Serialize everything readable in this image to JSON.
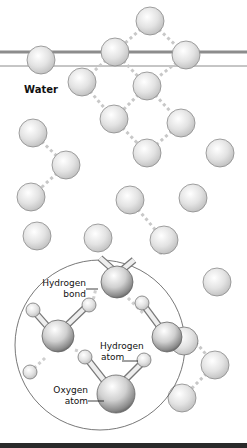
{
  "diagram": {
    "title": "Water",
    "labels": {
      "hydrogen_bond": [
        "Hydrogen",
        "bond"
      ],
      "hydrogen_atom": [
        "Hydrogen",
        "atom"
      ],
      "oxygen_atom": [
        "Oxygen",
        "atom"
      ]
    },
    "colors": {
      "sphere_fill": "#d9d9d9",
      "sphere_stroke": "#8a8a8a",
      "bond_dash": "#c8c8c8",
      "surface_line": "#8c8c8c",
      "bottom_bar": "#2a2a2a"
    },
    "surface_lines_y": [
      52,
      66
    ],
    "molecules": [
      {
        "x": 150,
        "y": 21
      },
      {
        "x": 115,
        "y": 52
      },
      {
        "x": 186,
        "y": 55
      },
      {
        "x": 41,
        "y": 60
      },
      {
        "x": 82,
        "y": 82
      },
      {
        "x": 147,
        "y": 86
      },
      {
        "x": 33,
        "y": 133
      },
      {
        "x": 114,
        "y": 119
      },
      {
        "x": 181,
        "y": 123
      },
      {
        "x": 147,
        "y": 153
      },
      {
        "x": 220,
        "y": 153
      },
      {
        "x": 66,
        "y": 165
      },
      {
        "x": 31,
        "y": 197
      },
      {
        "x": 130,
        "y": 200
      },
      {
        "x": 193,
        "y": 198
      },
      {
        "x": 37,
        "y": 236
      },
      {
        "x": 98,
        "y": 238
      },
      {
        "x": 164,
        "y": 240
      },
      {
        "x": 217,
        "y": 282
      },
      {
        "x": 215,
        "y": 365
      },
      {
        "x": 182,
        "y": 398
      }
    ],
    "hbonds": [
      [
        150,
        21,
        115,
        52
      ],
      [
        150,
        21,
        186,
        55
      ],
      [
        115,
        52,
        82,
        82
      ],
      [
        115,
        52,
        147,
        86
      ],
      [
        186,
        55,
        147,
        86
      ],
      [
        82,
        82,
        114,
        119
      ],
      [
        147,
        86,
        114,
        119
      ],
      [
        147,
        86,
        181,
        123
      ],
      [
        114,
        119,
        147,
        153
      ],
      [
        181,
        123,
        147,
        153
      ],
      [
        33,
        133,
        66,
        165
      ],
      [
        66,
        165,
        31,
        197
      ],
      [
        130,
        200,
        164,
        240
      ],
      [
        164,
        240,
        160,
        255
      ],
      [
        215,
        365,
        182,
        398
      ],
      [
        188,
        333,
        215,
        365
      ]
    ]
  }
}
